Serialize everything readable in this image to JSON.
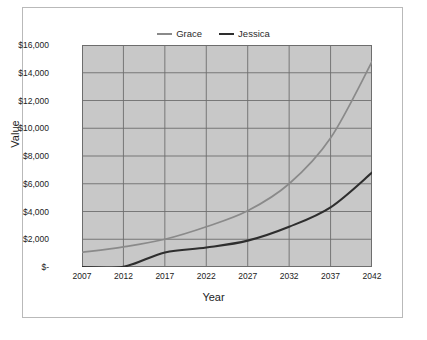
{
  "chart": {
    "title": "",
    "x_axis_title": "Year",
    "y_axis_title": "Value",
    "plot_background": "#c8c8c8",
    "gridline_color": "#6e6e6e",
    "panel_border": "#b9b9b9"
  },
  "legend": {
    "position": "top-center",
    "entries": [
      {
        "label": "Grace",
        "color": "#8a8a8a"
      },
      {
        "label": "Jessica",
        "color": "#2e2e2e"
      }
    ]
  },
  "axes": {
    "y_ticks": [
      "$16,000",
      "$14,000",
      "$12,000",
      "$10,000",
      "$8,000",
      "$6,000",
      "$4,000",
      "$2,000",
      "$-"
    ],
    "x_ticks": [
      "2007",
      "2012",
      "2017",
      "2022",
      "2027",
      "2032",
      "2037",
      "2042"
    ]
  },
  "chart_data": {
    "type": "line",
    "title": "",
    "xlabel": "Year",
    "ylabel": "Value",
    "xlim": [
      2007,
      2042
    ],
    "ylim": [
      0,
      16000
    ],
    "ytick_values": [
      0,
      2000,
      4000,
      6000,
      8000,
      10000,
      12000,
      14000,
      16000
    ],
    "xtick_values": [
      2007,
      2012,
      2017,
      2022,
      2027,
      2032,
      2037,
      2042
    ],
    "grid": true,
    "legend_position": "top-center",
    "x": [
      2007,
      2012,
      2017,
      2022,
      2027,
      2032,
      2037,
      2042
    ],
    "series": [
      {
        "name": "Grace",
        "color": "#8a8a8a",
        "values": [
          1050,
          1450,
          2000,
          2900,
          4050,
          6000,
          9300,
          14800
        ]
      },
      {
        "name": "Jessica",
        "color": "#2e2e2e",
        "values": [
          0,
          20,
          1050,
          1400,
          1900,
          2900,
          4300,
          6800
        ]
      }
    ]
  }
}
